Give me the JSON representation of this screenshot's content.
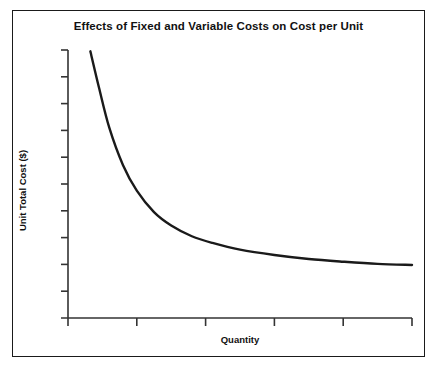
{
  "chart_data": {
    "type": "line",
    "title": "Effects of Fixed and Variable Costs on Cost per Unit",
    "xlabel": "Quantity",
    "ylabel": "Unit Total Cost ($)",
    "grid": false,
    "legend": null,
    "xlim": [
      0,
      10
    ],
    "ylim": [
      0,
      10
    ],
    "x_tick_labels": [
      "",
      "",
      "",
      "",
      "",
      ""
    ],
    "y_tick_labels": [
      "",
      "",
      "",
      "",
      "",
      "",
      "",
      "",
      "",
      ""
    ],
    "x_tick_count": 6,
    "y_tick_count": 10,
    "series": [
      {
        "name": "Unit Total Cost",
        "description": "Hyperbolic decay: fixed cost spread over increasing quantity approaching variable cost asymptote",
        "x": [
          0.65,
          0.9,
          1.2,
          1.6,
          2.0,
          2.5,
          3.0,
          3.6,
          4.2,
          5.0,
          6.0,
          7.0,
          8.0,
          9.0,
          10.0
        ],
        "y": [
          9.95,
          8.6,
          7.1,
          5.7,
          4.75,
          3.95,
          3.45,
          3.05,
          2.8,
          2.55,
          2.35,
          2.2,
          2.1,
          2.02,
          1.98
        ],
        "asymptote": 1.95
      }
    ],
    "colors": {
      "curve": "#1a1a1a",
      "axis": "#333333",
      "frame": "#1a1a1a",
      "background": "#ffffff"
    }
  }
}
